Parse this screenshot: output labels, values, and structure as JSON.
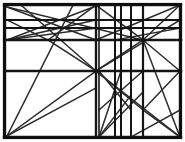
{
  "figure": {
    "type": "line-art",
    "width": 185,
    "height": 142,
    "background_color": "#ffffff",
    "ink_color": "#1a1a1a",
    "frame": {
      "x": 4,
      "y": 4,
      "width": 177,
      "height": 134,
      "stroke_width": 2.2
    },
    "horizontal_rules": [
      {
        "name": "rule-top-border",
        "y": 5,
        "x1": 4,
        "x2": 181,
        "stroke_width": 2.4
      },
      {
        "name": "rule-upper-1",
        "y": 20,
        "x1": 5,
        "x2": 181,
        "stroke_width": 2.2
      },
      {
        "name": "rule-upper-2",
        "y": 28,
        "x1": 5,
        "x2": 181,
        "stroke_width": 2.2
      },
      {
        "name": "rule-mid-major",
        "y": 40,
        "x1": 5,
        "x2": 181,
        "stroke_width": 2.6
      },
      {
        "name": "rule-center-major",
        "y": 71,
        "x1": 5,
        "x2": 181,
        "stroke_width": 2.6
      },
      {
        "name": "rule-bottom-border",
        "y": 137,
        "x1": 4,
        "x2": 181,
        "stroke_width": 2.4
      }
    ],
    "vertical_rules": [
      {
        "name": "rule-left-border",
        "x": 5,
        "y1": 5,
        "y2": 137,
        "stroke_width": 2.4
      },
      {
        "name": "rule-center-a",
        "x": 96,
        "y1": 5,
        "y2": 137,
        "stroke_width": 2.4
      },
      {
        "name": "rule-center-b",
        "x": 99,
        "y1": 5,
        "y2": 137,
        "stroke_width": 1.6
      },
      {
        "name": "rule-cluster-1",
        "x": 115,
        "y1": 5,
        "y2": 137,
        "stroke_width": 2.0
      },
      {
        "name": "rule-cluster-2",
        "x": 121,
        "y1": 5,
        "y2": 137,
        "stroke_width": 2.0
      },
      {
        "name": "rule-cluster-3",
        "x": 131,
        "y1": 5,
        "y2": 137,
        "stroke_width": 2.0
      },
      {
        "name": "rule-right-inner",
        "x": 143,
        "y1": 5,
        "y2": 137,
        "stroke_width": 2.2
      },
      {
        "name": "rule-right-border",
        "x": 180,
        "y1": 5,
        "y2": 137,
        "stroke_width": 2.4
      }
    ],
    "diagonals": [
      {
        "name": "diag-tl-to-mid-node",
        "x1": 7,
        "y1": 7,
        "x2": 96,
        "y2": 40
      },
      {
        "name": "diag-tl-long-right",
        "x1": 7,
        "y1": 7,
        "x2": 143,
        "y2": 40
      },
      {
        "name": "diag-upper-x-down",
        "x1": 22,
        "y1": 6,
        "x2": 96,
        "y2": 71
      },
      {
        "name": "diag-upper-x-up",
        "x1": 7,
        "y1": 40,
        "x2": 96,
        "y2": 6
      },
      {
        "name": "diag-left-fan-a",
        "x1": 7,
        "y1": 40,
        "x2": 96,
        "y2": 20
      },
      {
        "name": "diag-left-fan-b",
        "x1": 7,
        "y1": 40,
        "x2": 96,
        "y2": 28
      },
      {
        "name": "diag-node48-up",
        "x1": 48,
        "y1": 40,
        "x2": 96,
        "y2": 5
      },
      {
        "name": "diag-node48-down",
        "x1": 48,
        "y1": 40,
        "x2": 96,
        "y2": 71
      },
      {
        "name": "diag-node48-back-up",
        "x1": 48,
        "y1": 40,
        "x2": 7,
        "y2": 20
      },
      {
        "name": "diag-bl-to-topcenter",
        "x1": 7,
        "y1": 136,
        "x2": 73,
        "y2": 5
      },
      {
        "name": "diag-bl-to-node",
        "x1": 7,
        "y1": 136,
        "x2": 96,
        "y2": 71
      },
      {
        "name": "diag-bl-shallow",
        "x1": 7,
        "y1": 136,
        "x2": 96,
        "y2": 88
      },
      {
        "name": "diag-center-up-right",
        "x1": 96,
        "y1": 71,
        "x2": 143,
        "y2": 40
      },
      {
        "name": "diag-center-down",
        "x1": 96,
        "y1": 71,
        "x2": 143,
        "y2": 110
      },
      {
        "name": "diag-center-to-br",
        "x1": 96,
        "y1": 71,
        "x2": 180,
        "y2": 137
      },
      {
        "name": "diag-node143-up",
        "x1": 143,
        "y1": 40,
        "x2": 180,
        "y2": 5
      },
      {
        "name": "diag-node143-down",
        "x1": 143,
        "y1": 40,
        "x2": 180,
        "y2": 71
      },
      {
        "name": "diag-node143-to-br",
        "x1": 143,
        "y1": 40,
        "x2": 180,
        "y2": 137
      },
      {
        "name": "diag-right-x-a",
        "x1": 143,
        "y1": 40,
        "x2": 96,
        "y2": 5
      },
      {
        "name": "diag-right-x-b",
        "x1": 180,
        "y1": 5,
        "x2": 96,
        "y2": 40
      },
      {
        "name": "diag-right-long-down",
        "x1": 180,
        "y1": 20,
        "x2": 96,
        "y2": 71
      },
      {
        "name": "diag-right-shallow",
        "x1": 180,
        "y1": 28,
        "x2": 115,
        "y2": 40
      },
      {
        "name": "diag-cluster-up",
        "x1": 99,
        "y1": 137,
        "x2": 143,
        "y2": 92
      },
      {
        "name": "diag-cluster-up-2",
        "x1": 99,
        "y1": 137,
        "x2": 131,
        "y2": 95
      },
      {
        "name": "diag-cluster-steep",
        "x1": 99,
        "y1": 137,
        "x2": 121,
        "y2": 71
      },
      {
        "name": "diag-cluster-down",
        "x1": 99,
        "y1": 71,
        "x2": 131,
        "y2": 110
      },
      {
        "name": "diag-cluster-cross",
        "x1": 143,
        "y1": 71,
        "x2": 99,
        "y2": 110
      },
      {
        "name": "diag-lower-right-up",
        "x1": 143,
        "y1": 110,
        "x2": 180,
        "y2": 71
      },
      {
        "name": "diag-lower-right-down",
        "x1": 143,
        "y1": 110,
        "x2": 180,
        "y2": 137
      },
      {
        "name": "diag-br-to-node143",
        "x1": 180,
        "y1": 110,
        "x2": 131,
        "y2": 137
      }
    ]
  }
}
